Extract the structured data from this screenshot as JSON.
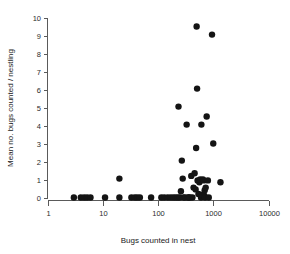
{
  "chart_data": {
    "type": "scatter",
    "title": "",
    "xlabel": "Bugs counted in nest",
    "ylabel": "Mean no. bugs counted / nestling",
    "xscale": "log",
    "yscale": "linear",
    "xlim": [
      1,
      10000
    ],
    "ylim": [
      0,
      10
    ],
    "xticks": [
      1,
      10,
      100,
      1000,
      10000
    ],
    "xticklabels": [
      "1",
      "10",
      "100",
      "1000",
      "10000"
    ],
    "yticks": [
      0,
      1,
      2,
      3,
      4,
      5,
      6,
      7,
      8,
      9,
      10
    ],
    "yticklabels": [
      "0",
      "1",
      "2",
      "3",
      "4",
      "5",
      "6",
      "7",
      "8",
      "9",
      "10"
    ],
    "grid": false,
    "legend": null,
    "marker": {
      "shape": "circle",
      "color": "#141414",
      "size": 3.2
    },
    "series": [
      {
        "name": "nests",
        "points": [
          [
            3.0,
            0.0
          ],
          [
            4.0,
            0.0
          ],
          [
            4.6,
            0.0
          ],
          [
            5.2,
            0.0
          ],
          [
            6.0,
            0.0
          ],
          [
            11.0,
            0.0
          ],
          [
            20.0,
            0.0
          ],
          [
            20.0,
            1.05
          ],
          [
            33.0,
            0.0
          ],
          [
            38.0,
            0.0
          ],
          [
            42.0,
            0.0
          ],
          [
            47.0,
            0.0
          ],
          [
            75.0,
            0.0
          ],
          [
            115.0,
            0.0
          ],
          [
            130.0,
            0.0
          ],
          [
            150.0,
            0.0
          ],
          [
            170.0,
            0.0
          ],
          [
            190.0,
            0.0
          ],
          [
            210.0,
            0.0
          ],
          [
            230.0,
            0.0
          ],
          [
            235.0,
            5.05
          ],
          [
            250.0,
            0.0
          ],
          [
            260.0,
            0.35
          ],
          [
            270.0,
            2.05
          ],
          [
            280.0,
            1.05
          ],
          [
            290.0,
            0.0
          ],
          [
            310.0,
            0.0
          ],
          [
            330.0,
            4.05
          ],
          [
            350.0,
            0.0
          ],
          [
            360.0,
            0.0
          ],
          [
            380.0,
            0.0
          ],
          [
            400.0,
            1.2
          ],
          [
            420.0,
            0.0
          ],
          [
            440.0,
            0.55
          ],
          [
            460.0,
            1.35
          ],
          [
            480.0,
            0.45
          ],
          [
            490.0,
            2.75
          ],
          [
            500.0,
            9.5
          ],
          [
            510.0,
            6.05
          ],
          [
            520.0,
            0.95
          ],
          [
            540.0,
            0.2
          ],
          [
            560.0,
            0.85
          ],
          [
            580.0,
            1.0
          ],
          [
            600.0,
            0.0
          ],
          [
            610.0,
            4.05
          ],
          [
            630.0,
            0.15
          ],
          [
            650.0,
            1.0
          ],
          [
            670.0,
            0.95
          ],
          [
            690.0,
            0.1
          ],
          [
            700.0,
            0.4
          ],
          [
            710.0,
            0.0
          ],
          [
            730.0,
            0.55
          ],
          [
            760.0,
            4.5
          ],
          [
            800.0,
            0.95
          ],
          [
            830.0,
            0.0
          ],
          [
            950.0,
            9.05
          ],
          [
            1000.0,
            3.0
          ],
          [
            1350.0,
            0.85
          ]
        ]
      }
    ]
  },
  "axes": {
    "x_label": "Bugs counted in nest",
    "y_label": "Mean no. bugs counted / nestling"
  }
}
